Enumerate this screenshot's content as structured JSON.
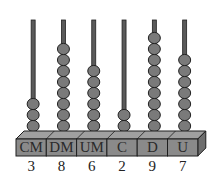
{
  "diagram": {
    "type": "abacus",
    "colors": {
      "rod": "#5a5a5a",
      "rod_outline": "#222222",
      "bead": "#7a7a7a",
      "bead_outline": "#222222",
      "base_front": "#8a8a8a",
      "base_top": "#a0a0a0",
      "base_side": "#6e6e6e",
      "outline": "#1e1e1e"
    },
    "columns": [
      {
        "label": "CM",
        "digit": "3",
        "beads": 3
      },
      {
        "label": "DM",
        "digit": "8",
        "beads": 8
      },
      {
        "label": "UM",
        "digit": "6",
        "beads": 6
      },
      {
        "label": "C",
        "digit": "2",
        "beads": 2
      },
      {
        "label": "D",
        "digit": "9",
        "beads": 9
      },
      {
        "label": "U",
        "digit": "7",
        "beads": 7
      }
    ],
    "number": "386297"
  }
}
